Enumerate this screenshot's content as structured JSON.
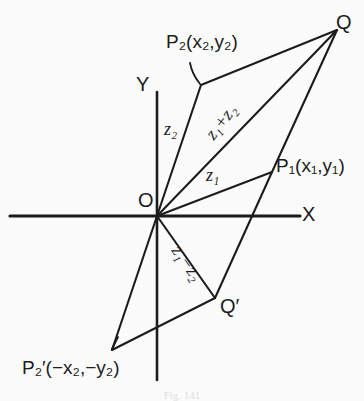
{
  "figure": {
    "kind": "geometry-diagram",
    "background_color": "#fbfbfb",
    "ink_color": "#1c1c1c",
    "caption": "Fig. 141"
  },
  "axes": {
    "x_label": "X",
    "y_label": "Y",
    "origin_label": "O"
  },
  "points": {
    "p1": "P₁(x₁,y₁)",
    "p2": "P₂(x₂,y₂)",
    "p2prime": "P₂′(−x₂,−y₂)",
    "q": "Q",
    "qprime": "Q′"
  },
  "vectors": {
    "z1": "z₁",
    "z2": "z₂",
    "z1_plus_z2": "z₁+z₂",
    "z1_minus_z2": "z₁−z₂"
  },
  "geometry": {
    "origin": [
      157,
      216
    ],
    "x_axis": [
      10,
      216,
      300,
      216
    ],
    "y_axis": [
      157,
      92,
      157,
      380
    ],
    "p1": [
      272,
      172
    ],
    "p2": [
      201,
      85
    ],
    "q": [
      337,
      30
    ],
    "qprime": [
      215,
      298
    ],
    "p2prime": [
      112,
      350
    ]
  }
}
